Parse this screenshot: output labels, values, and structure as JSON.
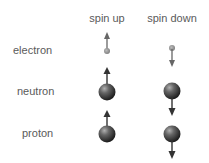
{
  "columns": [
    {
      "label": "spin up"
    },
    {
      "label": "spin down"
    }
  ],
  "rows": [
    {
      "label": "electron",
      "particle": "small-dot"
    },
    {
      "label": "neutron",
      "particle": "sphere"
    },
    {
      "label": "proton",
      "particle": "sphere"
    }
  ],
  "colors": {
    "text": "#5a5a5a",
    "arrow": "#555555",
    "sphere_dark": "#1e1e1e",
    "sphere_light": "#a8a8a8",
    "electron": "#8a8a8a"
  }
}
